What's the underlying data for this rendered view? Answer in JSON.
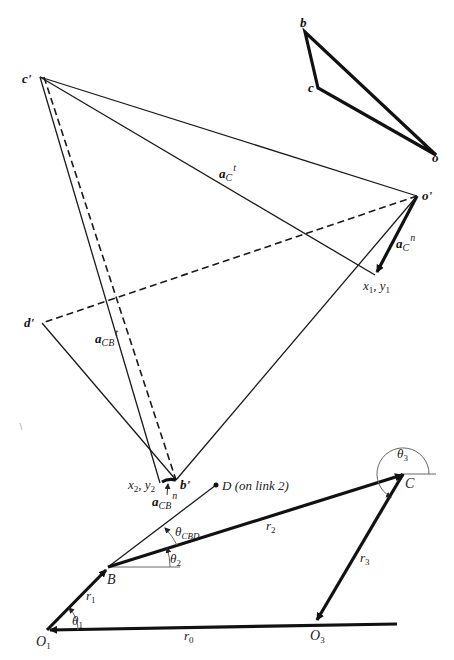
{
  "figure": {
    "velocity_polygon": {
      "labels": {
        "b": "b",
        "c": "c",
        "o": "o"
      }
    },
    "acceleration_polygon": {
      "points": {
        "c_prime": "c'",
        "o_prime": "o'",
        "d_prime": "d'",
        "b_prime": "b'",
        "x1y1_x": "x",
        "x1y1_x_sub": "1",
        "x1y1_sep": ", ",
        "x1y1_y": "y",
        "x1y1_y_sub": "1",
        "x2y2_x": "x",
        "x2y2_x_sub": "2",
        "x2y2_sep": ", ",
        "x2y2_y": "y",
        "x2y2_y_sub": "2"
      },
      "vectors": {
        "aC_t": {
          "base": "a",
          "sub": "C",
          "sup": "t"
        },
        "aC_n": {
          "base": "a",
          "sub": "C",
          "sup": "n"
        },
        "aCB_t": {
          "base": "a",
          "sub": "CB",
          "sup": "t"
        },
        "aCB_n": {
          "base": "a",
          "sub": "CB",
          "sup": "n"
        }
      }
    },
    "mechanism": {
      "points": {
        "D": "D (on link 2)",
        "B": "B",
        "C": "C",
        "O1": {
          "base": "O",
          "sub": "1"
        },
        "O3": {
          "base": "O",
          "sub": "3"
        }
      },
      "links": {
        "r0": {
          "base": "r",
          "sub": "0"
        },
        "r1": {
          "base": "r",
          "sub": "1"
        },
        "r2": {
          "base": "r",
          "sub": "2"
        },
        "r3": {
          "base": "r",
          "sub": "3"
        }
      },
      "angles": {
        "theta1": {
          "base": "θ",
          "sub": "1"
        },
        "theta2": {
          "base": "θ",
          "sub": "2"
        },
        "theta3": {
          "base": "θ",
          "sub": "3"
        },
        "thetaCBD": {
          "base": "θ",
          "sub": "CBD"
        }
      }
    }
  }
}
